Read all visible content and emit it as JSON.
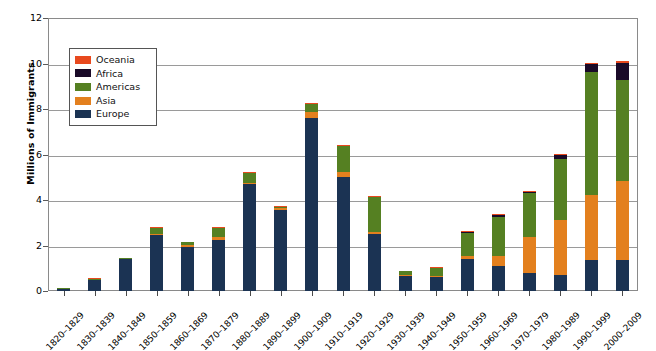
{
  "chart_data": {
    "type": "bar",
    "subtype": "stacked-vertical",
    "title": "",
    "xlabel": "",
    "ylabel": "Millions of Immigrants",
    "ylim": [
      0,
      12
    ],
    "yticks": [
      0,
      2,
      4,
      6,
      8,
      10,
      12
    ],
    "ytick_labels": [
      "0",
      "2",
      "4",
      "6",
      "8",
      "10",
      "12"
    ],
    "grid": "horizontal",
    "legend_position": "upper-left-inside",
    "legend_order_top_to_bottom": [
      "Oceania",
      "Africa",
      "Americas",
      "Asia",
      "Europe"
    ],
    "stack_order_bottom_to_top": [
      "Europe",
      "Asia",
      "Americas",
      "Africa",
      "Oceania"
    ],
    "categories": [
      "1820–1829",
      "1830–1839",
      "1840–1849",
      "1850–1859",
      "1860–1869",
      "1870–1879",
      "1880–1889",
      "1890–1899",
      "1900–1909",
      "1910–1919",
      "1920–1929",
      "1930–1939",
      "1940–1949",
      "1950–1959",
      "1960–1969",
      "1970–1979",
      "1980–1989",
      "1990–1999",
      "2000–2009"
    ],
    "series": [
      {
        "name": "Europe",
        "color": "#1b3353",
        "values": [
          0.1,
          0.48,
          1.4,
          2.45,
          1.95,
          2.25,
          4.7,
          3.58,
          7.6,
          5.0,
          2.5,
          0.65,
          0.62,
          1.4,
          1.12,
          0.8,
          0.7,
          1.35,
          1.35
        ]
      },
      {
        "name": "Asia",
        "color": "#e3801e",
        "values": [
          0.0,
          0.0,
          0.0,
          0.04,
          0.05,
          0.12,
          0.06,
          0.05,
          0.25,
          0.24,
          0.11,
          0.02,
          0.04,
          0.15,
          0.43,
          1.59,
          2.42,
          2.86,
          3.5
        ]
      },
      {
        "name": "Americas",
        "color": "#558022",
        "values": [
          0.02,
          0.02,
          0.04,
          0.26,
          0.17,
          0.41,
          0.43,
          0.04,
          0.38,
          1.14,
          1.52,
          0.16,
          0.35,
          1.0,
          1.72,
          1.9,
          2.7,
          5.4,
          4.44
        ]
      },
      {
        "name": "Africa",
        "color": "#1a0a28",
        "values": [
          0.0,
          0.0,
          0.0,
          0.0,
          0.0,
          0.0,
          0.0,
          0.0,
          0.0,
          0.0,
          0.0,
          0.0,
          0.0,
          0.01,
          0.03,
          0.07,
          0.14,
          0.35,
          0.75
        ]
      },
      {
        "name": "Oceania",
        "color": "#e8491e",
        "values": [
          0.0,
          0.01,
          0.0,
          0.01,
          0.0,
          0.01,
          0.01,
          0.01,
          0.01,
          0.01,
          0.01,
          0.0,
          0.01,
          0.01,
          0.02,
          0.04,
          0.04,
          0.06,
          0.06
        ]
      }
    ],
    "totals": [
      0.12,
      0.51,
      1.44,
      2.76,
      2.17,
      2.79,
      5.2,
      3.68,
      8.24,
      6.39,
      4.14,
      0.83,
      1.02,
      2.57,
      3.32,
      4.4,
      6.0,
      9.82,
      10.1
    ]
  },
  "legend": {
    "items": [
      {
        "label": "Oceania",
        "color": "#e8491e"
      },
      {
        "label": "Africa",
        "color": "#1a0a28"
      },
      {
        "label": "Americas",
        "color": "#558022"
      },
      {
        "label": "Asia",
        "color": "#e3801e"
      },
      {
        "label": "Europe",
        "color": "#1b3353"
      }
    ]
  },
  "axis": {
    "y_title": "Millions of Immigrants"
  }
}
